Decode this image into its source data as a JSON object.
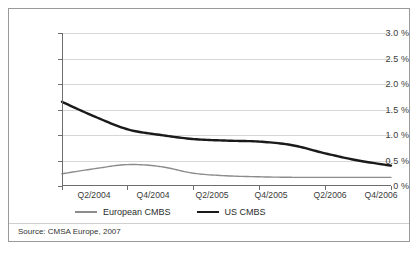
{
  "figure": {
    "source_note": "Source: CMSA Europe, 2007"
  },
  "legend": {
    "position": "bottom-left",
    "entries": [
      {
        "label": "European CMBS",
        "color": "#8c8c8c",
        "style": "thin-line"
      },
      {
        "label": "US CMBS",
        "color": "#1a1a1a",
        "style": "thick-line"
      }
    ]
  },
  "axes": {
    "y_tick_labels": [
      "3.0 %",
      "2.5 %",
      "2.0 %",
      "1.5 %",
      "1.0 %",
      "0.5 %",
      "0 %"
    ],
    "x_tick_labels": [
      "Q2/2004",
      "Q4/2004",
      "Q2/2005",
      "Q4/2005",
      "Q2/2006",
      "Q4/2006"
    ]
  },
  "chart_data": {
    "type": "line",
    "title": "",
    "subtitle": "",
    "xlabel": "",
    "ylabel": "",
    "ylim": [
      0,
      3.0
    ],
    "y_tick_values": [
      0,
      0.5,
      1.0,
      1.5,
      2.0,
      2.5,
      3.0
    ],
    "y_unit": "%",
    "grid": "horizontal",
    "legend_position": "bottom-left",
    "x": [
      "Q2/2004",
      "Q3/2004",
      "Q4/2004",
      "Q1/2005",
      "Q2/2005",
      "Q3/2005",
      "Q4/2005",
      "Q1/2006",
      "Q2/2006",
      "Q3/2006",
      "Q4/2006"
    ],
    "x_tick_labels": [
      "Q2/2004",
      "Q4/2004",
      "Q2/2005",
      "Q4/2005",
      "Q2/2006",
      "Q4/2006"
    ],
    "series": [
      {
        "name": "European CMBS",
        "color": "#8c8c8c",
        "line_width": 1.4,
        "values": [
          0.24,
          0.34,
          0.42,
          0.38,
          0.25,
          0.2,
          0.18,
          0.17,
          0.17,
          0.17,
          0.17
        ]
      },
      {
        "name": "US CMBS",
        "color": "#1a1a1a",
        "line_width": 2.4,
        "values": [
          1.65,
          1.36,
          1.11,
          1.0,
          0.92,
          0.89,
          0.87,
          0.8,
          0.64,
          0.5,
          0.4
        ]
      }
    ],
    "source": "Source: CMSA Europe, 2007"
  }
}
